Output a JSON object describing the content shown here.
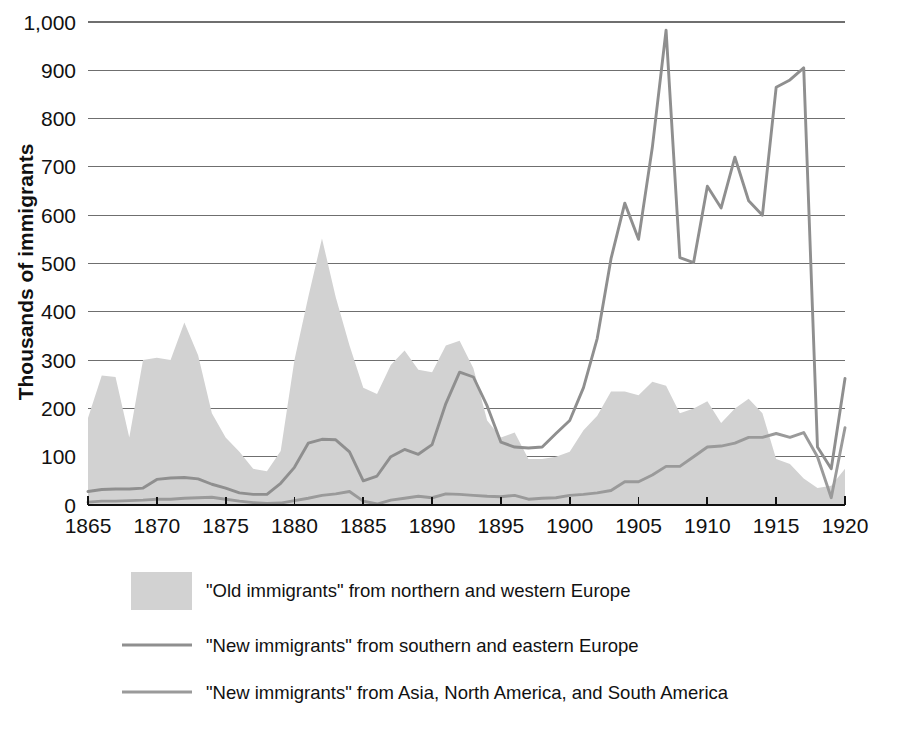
{
  "chart_data": {
    "type": "area",
    "title": "",
    "subtitle": "",
    "xlabel": "",
    "ylabel": "Thousands of immigrants",
    "xlim": [
      1865,
      1920
    ],
    "ylim": [
      0,
      1000
    ],
    "grid": true,
    "legend_position": "bottom",
    "y_ticks": [
      "0",
      "100",
      "200",
      "300",
      "400",
      "500",
      "600",
      "700",
      "800",
      "900",
      "1,000"
    ],
    "y_tick_values": [
      0,
      100,
      200,
      300,
      400,
      500,
      600,
      700,
      800,
      900,
      1000
    ],
    "x_ticks": [
      "1865",
      "1870",
      "1875",
      "1880",
      "1885",
      "1890",
      "1895",
      "1900",
      "1905",
      "1910",
      "1915",
      "1920"
    ],
    "x_tick_values": [
      1865,
      1870,
      1875,
      1880,
      1885,
      1890,
      1895,
      1900,
      1905,
      1910,
      1915,
      1920
    ],
    "x": [
      1865,
      1866,
      1867,
      1868,
      1869,
      1870,
      1871,
      1872,
      1873,
      1874,
      1875,
      1876,
      1877,
      1878,
      1879,
      1880,
      1881,
      1882,
      1883,
      1884,
      1885,
      1886,
      1887,
      1888,
      1889,
      1890,
      1891,
      1892,
      1893,
      1894,
      1895,
      1896,
      1897,
      1898,
      1899,
      1900,
      1901,
      1902,
      1903,
      1904,
      1905,
      1906,
      1907,
      1908,
      1909,
      1910,
      1911,
      1912,
      1913,
      1914,
      1915,
      1916,
      1917,
      1918,
      1919,
      1920
    ],
    "series": [
      {
        "name": "\"Old immigrants\" from northern and western Europe",
        "type": "area",
        "color": "#d2d2d2",
        "values": [
          180,
          268,
          265,
          140,
          300,
          305,
          300,
          378,
          310,
          190,
          140,
          110,
          75,
          70,
          112,
          300,
          430,
          552,
          430,
          330,
          243,
          230,
          290,
          320,
          280,
          275,
          330,
          340,
          283,
          175,
          140,
          150,
          95,
          95,
          100,
          110,
          155,
          185,
          235,
          235,
          227,
          255,
          247,
          190,
          200,
          215,
          170,
          200,
          220,
          190,
          95,
          85,
          55,
          35,
          40,
          75
        ]
      },
      {
        "name": "\"New immigrants\" from southern and eastern Europe",
        "type": "line",
        "color": "#8f8f8f",
        "values": [
          28,
          32,
          33,
          33,
          35,
          53,
          56,
          57,
          54,
          43,
          35,
          25,
          22,
          22,
          45,
          78,
          128,
          136,
          135,
          110,
          50,
          60,
          100,
          115,
          105,
          125,
          210,
          275,
          265,
          205,
          130,
          120,
          118,
          120,
          148,
          175,
          243,
          345,
          510,
          625,
          550,
          740,
          983,
          512,
          502,
          660,
          615,
          720,
          630,
          600,
          865,
          880,
          905,
          120,
          75,
          262
        ]
      },
      {
        "name": "\"New immigrants\" from Asia, North America, and South America",
        "type": "line",
        "color": "#9a9a9a",
        "values": [
          6,
          8,
          8,
          9,
          10,
          12,
          12,
          14,
          15,
          16,
          12,
          8,
          5,
          3,
          4,
          9,
          14,
          20,
          23,
          28,
          8,
          2,
          10,
          14,
          18,
          15,
          23,
          22,
          20,
          18,
          17,
          20,
          12,
          14,
          15,
          20,
          22,
          25,
          30,
          48,
          48,
          62,
          80,
          80,
          100,
          120,
          122,
          128,
          140,
          140,
          148,
          140,
          150,
          100,
          15,
          160
        ]
      }
    ]
  },
  "legend": [
    {
      "marker": "swatch",
      "label": "\"Old immigrants\" from northern and western Europe",
      "color": "#d2d2d2"
    },
    {
      "marker": "line",
      "label": "\"New immigrants\" from southern and eastern Europe",
      "color": "#8f8f8f"
    },
    {
      "marker": "line",
      "label": "\"New immigrants\" from Asia, North America, and South America",
      "color": "#9a9a9a"
    }
  ]
}
